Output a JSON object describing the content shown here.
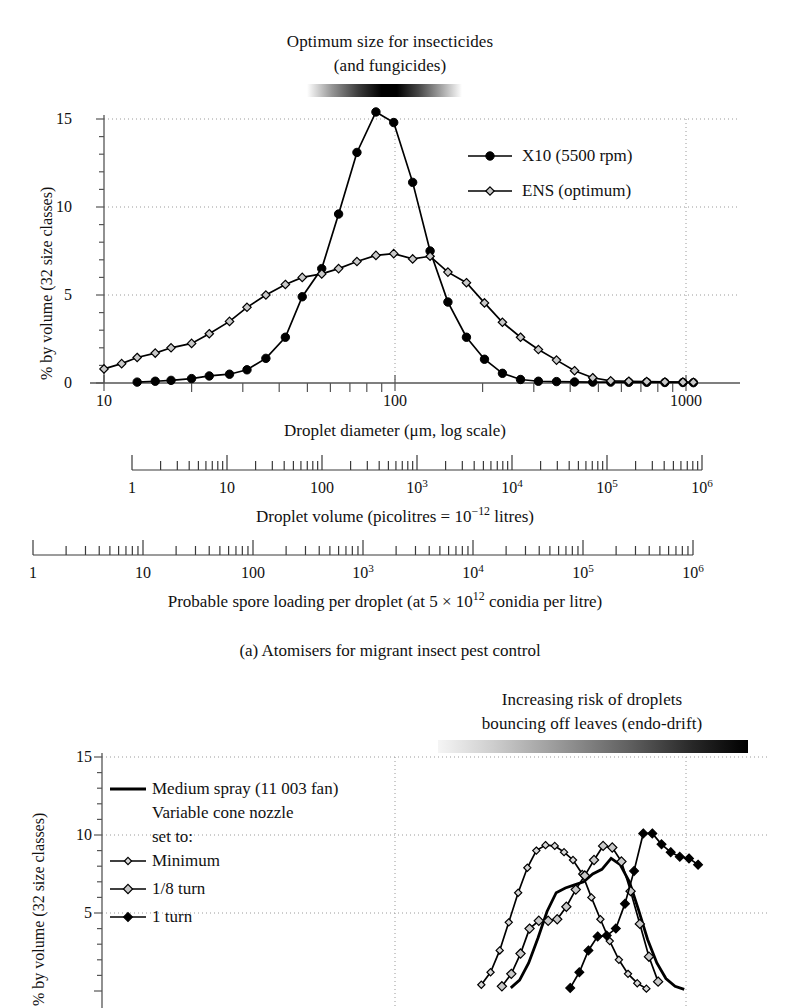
{
  "figure": {
    "panel_a_caption": "(a) Atomisers for migrant insect pest control",
    "top_annotation_line1": "Optimum size for insecticides",
    "top_annotation_line2": "(and fungicides)",
    "panel_b_annotation_line1": "Increasing risk of droplets",
    "panel_b_annotation_line2": "bouncing off leaves (endo-drift)"
  },
  "axes": {
    "y_title": "% by volume (32 size classes)",
    "y_ticks": [
      "0",
      "5",
      "10",
      "15"
    ],
    "x_title_main": "Droplet diameter (μm, log scale)",
    "x_ticks_main": [
      "10",
      "100",
      "1000"
    ],
    "ruler_volume_title_pre": "Droplet volume (picolitres = 10",
    "ruler_volume_title_sup": "−12",
    "ruler_volume_title_post": " litres)",
    "ruler_spore_title_pre": "Probable spore loading per droplet (at 5 × 10",
    "ruler_spore_title_sup": "12",
    "ruler_spore_title_post": " conidia per litre)",
    "ruler_ticks": [
      "1",
      "10",
      "100",
      "10",
      "10",
      "10",
      "10"
    ],
    "ruler_tick_labels": [
      {
        "text": "1",
        "sup": ""
      },
      {
        "text": "10",
        "sup": ""
      },
      {
        "text": "100",
        "sup": ""
      },
      {
        "text": "10",
        "sup": "3"
      },
      {
        "text": "10",
        "sup": "4"
      },
      {
        "text": "10",
        "sup": "5"
      },
      {
        "text": "10",
        "sup": "6"
      }
    ]
  },
  "legend_a": {
    "items": [
      {
        "label": "X10 (5500 rpm)",
        "marker": "filled-circle"
      },
      {
        "label": "ENS (optimum)",
        "marker": "open-diamond"
      }
    ]
  },
  "legend_b": {
    "title_line1": "Medium spray (11 003 fan)",
    "title_line2": "Variable cone nozzle",
    "title_line3": "set to:",
    "items": [
      {
        "label": "Minimum",
        "marker": "small-open-diamond"
      },
      {
        "label": "1/8 turn",
        "marker": "grey-diamond"
      },
      {
        "label": "1 turn",
        "marker": "filled-diamond"
      }
    ]
  },
  "colors": {
    "ink": "#000000",
    "axis": "#555555",
    "grid": "#9a9a9a",
    "marker_grey": "#c9c9c9",
    "background": "#ffffff"
  },
  "chart_data": [
    {
      "type": "line",
      "id": "panel-a",
      "title": "(a) Atomisers for migrant insect pest control",
      "xlabel": "Droplet diameter (μm, log scale)",
      "ylabel": "% by volume (32 size classes)",
      "xscale": "log",
      "xlim": [
        10,
        1100
      ],
      "ylim": [
        0,
        15.8
      ],
      "yticks": [
        0,
        5,
        10,
        15
      ],
      "xticks": [
        10,
        100,
        1000
      ],
      "grid": true,
      "legend_position": "upper-right",
      "series": [
        {
          "name": "X10 (5500 rpm)",
          "marker": "filled-circle",
          "x": [
            13,
            15,
            17,
            20,
            23,
            27,
            31,
            36,
            42,
            48,
            56,
            64,
            74,
            86,
            99,
            115,
            132,
            152,
            176,
            203,
            234,
            270,
            311,
            359,
            414,
            478,
            551,
            636,
            733,
            846,
            976,
            1060
          ],
          "y": [
            0.05,
            0.1,
            0.15,
            0.25,
            0.4,
            0.5,
            0.75,
            1.4,
            2.6,
            4.9,
            6.5,
            9.6,
            13.1,
            15.4,
            14.8,
            11.4,
            7.5,
            4.6,
            2.6,
            1.35,
            0.55,
            0.2,
            0.1,
            0.08,
            0.06,
            0.05,
            0.05,
            0.04,
            0.04,
            0.03,
            0.03,
            0.02
          ]
        },
        {
          "name": "ENS (optimum)",
          "marker": "open-diamond",
          "x": [
            10,
            11.5,
            13,
            15,
            17,
            20,
            23,
            27,
            31,
            36,
            42,
            48,
            56,
            64,
            74,
            86,
            99,
            115,
            132,
            152,
            176,
            203,
            234,
            270,
            311,
            359,
            414,
            478,
            551,
            636,
            733,
            846,
            976,
            1060
          ],
          "y": [
            0.8,
            1.1,
            1.45,
            1.7,
            2.0,
            2.25,
            2.8,
            3.5,
            4.3,
            5.0,
            5.6,
            6.0,
            6.2,
            6.5,
            6.9,
            7.25,
            7.35,
            7.05,
            7.2,
            6.3,
            5.7,
            4.55,
            3.45,
            2.6,
            1.9,
            1.3,
            0.7,
            0.3,
            0.12,
            0.1,
            0.08,
            0.06,
            0.05,
            0.04
          ]
        }
      ]
    },
    {
      "type": "line",
      "id": "panel-b",
      "ylabel": "% by volume (32 size classes)",
      "xscale": "log",
      "ylim": [
        0,
        15.8
      ],
      "yticks": [
        0,
        5,
        10,
        15
      ],
      "grid": true,
      "legend_position": "upper-left",
      "series": [
        {
          "name": "Medium spray (11 003 fan)",
          "marker": "none",
          "x": [
            250,
            268,
            288,
            310,
            333,
            358,
            385,
            414,
            445,
            478,
            514,
            553,
            594,
            639,
            687,
            738,
            794,
            853,
            917,
            986
          ],
          "y": [
            0.2,
            0.7,
            1.8,
            3.4,
            5.1,
            6.3,
            6.6,
            6.8,
            7.0,
            7.5,
            7.8,
            8.5,
            8.1,
            7.0,
            5.2,
            3.3,
            1.8,
            0.8,
            0.3,
            0.1
          ]
        },
        {
          "name": "Minimum",
          "marker": "small-open-diamond",
          "x": [
            198,
            213,
            229,
            246,
            265,
            285,
            306,
            329,
            354,
            381,
            409,
            440,
            473,
            508,
            547,
            588,
            632,
            680,
            731
          ],
          "y": [
            0.4,
            1.2,
            2.6,
            4.4,
            6.3,
            7.9,
            9.0,
            9.35,
            9.3,
            8.9,
            8.4,
            7.5,
            6.0,
            4.6,
            3.2,
            2.0,
            1.1,
            0.5,
            0.15
          ]
        },
        {
          "name": "1/8 turn",
          "marker": "grey-diamond",
          "x": [
            233,
            251,
            270,
            290,
            312,
            336,
            361,
            388,
            418,
            449,
            483,
            519,
            558,
            600,
            645,
            694,
            746,
            802
          ],
          "y": [
            0.3,
            1.1,
            2.4,
            4.0,
            4.5,
            4.5,
            4.6,
            5.4,
            6.5,
            7.4,
            8.4,
            9.3,
            9.2,
            8.3,
            6.4,
            4.3,
            2.2,
            0.6
          ]
        },
        {
          "name": "1 turn",
          "marker": "filled-diamond",
          "x": [
            400,
            430,
            462,
            497,
            534,
            574,
            617,
            663,
            713,
            766,
            824,
            886,
            952,
            1024,
            1100
          ],
          "y": [
            0.2,
            1.2,
            2.6,
            3.5,
            3.55,
            4.0,
            5.6,
            7.7,
            10.1,
            10.1,
            9.4,
            8.9,
            8.6,
            8.5,
            8.1
          ]
        }
      ]
    }
  ]
}
